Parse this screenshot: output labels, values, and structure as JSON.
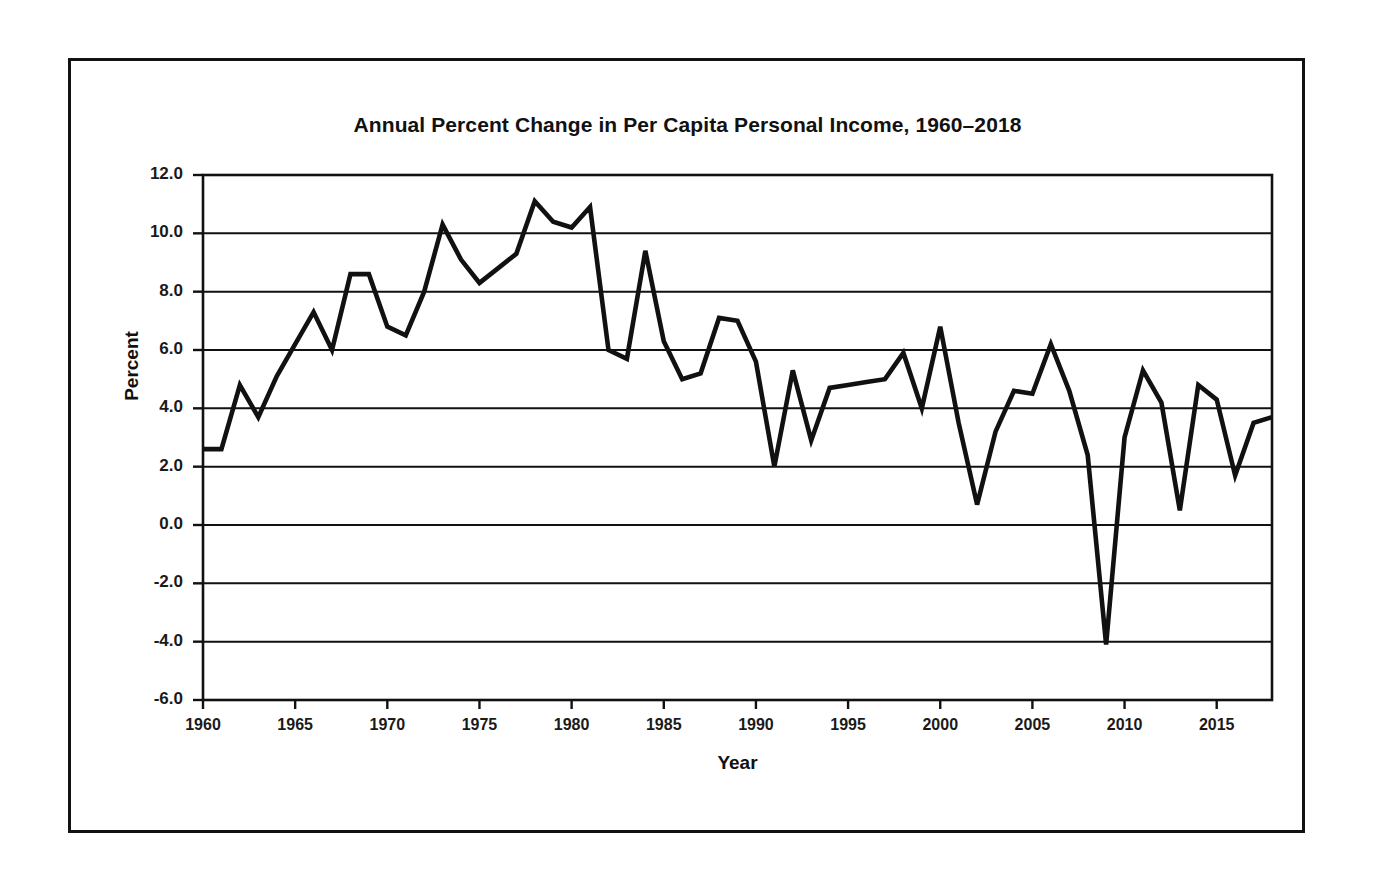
{
  "chart_data": {
    "type": "line",
    "title": "Annual Percent Change in Per Capita Personal Income, 1960–2018",
    "xlabel": "Year",
    "ylabel": "Percent",
    "xlim": [
      1960,
      2018
    ],
    "ylim": [
      -6.0,
      12.0
    ],
    "grid": "horizontal",
    "legend": "none",
    "line_color": "#111111",
    "x_ticks": [
      "1960",
      "1965",
      "1970",
      "1975",
      "1980",
      "1985",
      "1990",
      "1995",
      "2000",
      "2005",
      "2010",
      "2015"
    ],
    "x_tick_values": [
      1960,
      1965,
      1970,
      1975,
      1980,
      1985,
      1990,
      1995,
      2000,
      2005,
      2010,
      2015
    ],
    "y_ticks": [
      "12.0",
      "10.0",
      "8.0",
      "6.0",
      "4.0",
      "2.0",
      "0.0",
      "-2.0",
      "-4.0",
      "-6.0"
    ],
    "y_tick_values": [
      12.0,
      10.0,
      8.0,
      6.0,
      4.0,
      2.0,
      0.0,
      -2.0,
      -4.0,
      -6.0
    ],
    "x": [
      1960,
      1961,
      1962,
      1963,
      1964,
      1965,
      1966,
      1967,
      1968,
      1969,
      1970,
      1971,
      1972,
      1973,
      1974,
      1975,
      1976,
      1977,
      1978,
      1979,
      1980,
      1981,
      1982,
      1983,
      1984,
      1985,
      1986,
      1987,
      1988,
      1989,
      1990,
      1991,
      1992,
      1993,
      1994,
      1995,
      1996,
      1997,
      1998,
      1999,
      2000,
      2001,
      2002,
      2003,
      2004,
      2005,
      2006,
      2007,
      2008,
      2009,
      2010,
      2011,
      2012,
      2013,
      2014,
      2015,
      2016,
      2017,
      2018
    ],
    "values": [
      2.6,
      2.6,
      4.8,
      3.7,
      5.1,
      6.2,
      7.3,
      6.0,
      8.6,
      8.6,
      6.8,
      6.5,
      8.0,
      10.3,
      9.1,
      8.3,
      8.8,
      9.3,
      11.1,
      10.4,
      10.2,
      10.9,
      6.0,
      5.7,
      9.4,
      6.3,
      5.0,
      5.2,
      7.1,
      7.0,
      5.6,
      2.0,
      5.3,
      2.9,
      4.7,
      4.8,
      4.9,
      5.0,
      5.9,
      4.0,
      6.8,
      3.5,
      0.7,
      3.2,
      4.6,
      4.5,
      6.2,
      4.6,
      2.4,
      -4.1,
      3.0,
      5.3,
      4.2,
      0.5,
      4.8,
      4.3,
      1.7,
      3.5,
      3.7
    ]
  }
}
